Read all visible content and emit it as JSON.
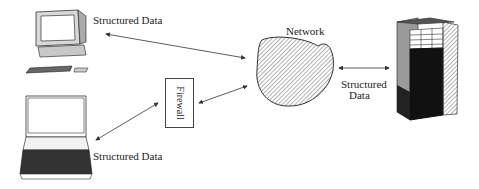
{
  "diagram": {
    "nodes": {
      "desktop": {
        "label": "Structured Data",
        "icon": "desktop-computer-icon"
      },
      "laptop": {
        "label": "Structured Data",
        "icon": "laptop-icon"
      },
      "firewall": {
        "label": "Firewall"
      },
      "network": {
        "label": "Network",
        "icon": "network-cloud-icon"
      },
      "server": {
        "label_line1": "Structured",
        "label_line2": "Data",
        "icon": "server-tower-icon"
      }
    },
    "edges": [
      {
        "from": "desktop",
        "to": "network",
        "type": "bidirectional"
      },
      {
        "from": "laptop",
        "to": "firewall",
        "type": "bidirectional"
      },
      {
        "from": "firewall",
        "to": "network",
        "type": "bidirectional"
      },
      {
        "from": "network",
        "to": "server",
        "type": "bidirectional"
      }
    ],
    "colors": {
      "line": "#333333",
      "hatch": "#555555",
      "fill_dark": "#111111",
      "fill_gray": "#9a9a9a"
    }
  }
}
